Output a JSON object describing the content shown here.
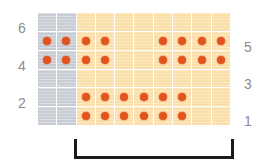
{
  "chart_data": {
    "type": "heatmap",
    "title": "",
    "xlabel": "",
    "ylabel": "",
    "grid": true,
    "legend_position": "none",
    "columns": 10,
    "rows": 6,
    "row_order_top_to_bottom": [
      6,
      5,
      4,
      3,
      2,
      1
    ],
    "left_axis_tick_labels": [
      "6",
      "4",
      "2"
    ],
    "right_axis_tick_labels": [
      "5",
      "3",
      "1"
    ],
    "left_axis_tick_rows": [
      6,
      4,
      2
    ],
    "right_axis_tick_rows": [
      5,
      3,
      1
    ],
    "cell_shading_by_column": [
      "grey",
      "grey",
      "tan",
      "tan",
      "tan",
      "tan",
      "tan",
      "tan",
      "tan",
      "tan"
    ],
    "dot_matrix_top_to_bottom": [
      [
        0,
        0,
        0,
        0,
        0,
        0,
        0,
        0,
        0,
        0
      ],
      [
        1,
        1,
        1,
        1,
        0,
        0,
        1,
        1,
        1,
        1
      ],
      [
        1,
        1,
        1,
        1,
        0,
        0,
        1,
        1,
        1,
        1
      ],
      [
        0,
        0,
        0,
        0,
        0,
        0,
        0,
        0,
        0,
        0
      ],
      [
        0,
        0,
        1,
        1,
        1,
        1,
        1,
        1,
        0,
        0
      ],
      [
        0,
        0,
        1,
        1,
        1,
        1,
        1,
        1,
        0,
        0
      ]
    ],
    "dot_counts_per_row_top_to_bottom": [
      0,
      8,
      8,
      0,
      6,
      6
    ],
    "total_dots": 28,
    "colors": {
      "dot": "#e2541f",
      "cell_tan": "#fbdfa8",
      "cell_grey": "#c8cdd4",
      "gridline": "#ffffff",
      "axis_label": "#8a8d91",
      "bracket": "#1a1a1a"
    },
    "bracket": {
      "orientation": "bottom",
      "label": "",
      "spans_columns": [
        3,
        10
      ]
    }
  }
}
